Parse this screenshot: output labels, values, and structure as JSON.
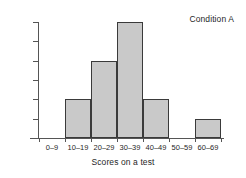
{
  "chart_data": {
    "type": "bar",
    "title": "",
    "annotation": "Condition A",
    "xlabel": "Scores on a test",
    "ylabel": "Frequency",
    "categories": [
      "0–9",
      "10–19",
      "20–29",
      "30–39",
      "40–49",
      "50–59",
      "60–69"
    ],
    "values": [
      0,
      2,
      4,
      6,
      2,
      0,
      1
    ],
    "ylim": [
      0,
      6
    ],
    "ytick_values": [
      1,
      2,
      3,
      4,
      5,
      6
    ],
    "ytick_labels": [
      "",
      "",
      "",
      "",
      "",
      ""
    ],
    "grid": false,
    "legend": false,
    "bar_fill_color": "#c9c9c9",
    "bar_edge_color": "#3a3a3a",
    "axis_color": "#555555",
    "background_color": "#ffffff"
  }
}
